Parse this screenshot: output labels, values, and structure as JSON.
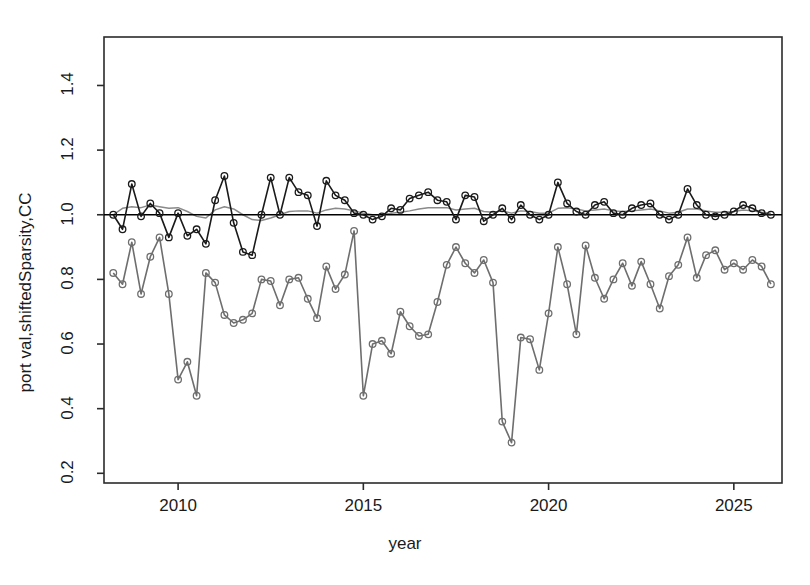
{
  "chart_data": {
    "type": "line",
    "title": "",
    "xlabel": "year",
    "ylabel": "port val,shiftedSparsity,CC",
    "xlim": [
      2008.0,
      2026.3
    ],
    "ylim": [
      0.17,
      1.55
    ],
    "xticks": [
      2010,
      2015,
      2020,
      2025
    ],
    "xtick_labels": [
      "2010",
      "2015",
      "2020",
      "2025"
    ],
    "yticks": [
      0.2,
      0.4,
      0.6,
      0.8,
      1.0,
      1.2,
      1.4
    ],
    "ytick_labels": [
      "0.2",
      "0.4",
      "0.6",
      "0.8",
      "1.0",
      "1.2",
      "1.4"
    ],
    "grid": false,
    "legend": "none",
    "box": true,
    "colors": {
      "port_val": "#1a1a1a",
      "reference": "#000000",
      "trend": "#8a8a8a",
      "sparsity": "#6e6e6e",
      "axis": "#2b2b2b",
      "background": "#ffffff"
    },
    "series": [
      {
        "name": "port val",
        "color": "#1a1a1a",
        "marker": "open-circle",
        "x": [
          2008.25,
          2008.5,
          2008.75,
          2009.0,
          2009.25,
          2009.5,
          2009.75,
          2010.0,
          2010.25,
          2010.5,
          2010.75,
          2011.0,
          2011.25,
          2011.5,
          2011.75,
          2012.0,
          2012.25,
          2012.5,
          2012.75,
          2013.0,
          2013.25,
          2013.5,
          2013.75,
          2014.0,
          2014.25,
          2014.5,
          2014.75,
          2015.0,
          2015.25,
          2015.5,
          2015.75,
          2016.0,
          2016.25,
          2016.5,
          2016.75,
          2017.0,
          2017.25,
          2017.5,
          2017.75,
          2018.0,
          2018.25,
          2018.5,
          2018.75,
          2019.0,
          2019.25,
          2019.5,
          2019.75,
          2020.0,
          2020.25,
          2020.5,
          2020.75,
          2021.0,
          2021.25,
          2021.5,
          2021.75,
          2022.0,
          2022.25,
          2022.5,
          2022.75,
          2023.0,
          2023.25,
          2023.5,
          2023.75,
          2024.0,
          2024.25,
          2024.5,
          2024.75,
          2025.0,
          2025.25,
          2025.5,
          2025.75,
          2026.0
        ],
        "y": [
          1.0,
          0.955,
          1.095,
          0.995,
          1.035,
          1.005,
          0.93,
          1.005,
          0.935,
          0.955,
          0.91,
          1.045,
          1.12,
          0.975,
          0.885,
          0.875,
          1.0,
          1.115,
          1.0,
          1.115,
          1.07,
          1.06,
          0.965,
          1.105,
          1.06,
          1.045,
          1.005,
          1.0,
          0.985,
          0.995,
          1.02,
          1.015,
          1.05,
          1.06,
          1.07,
          1.045,
          1.04,
          0.985,
          1.06,
          1.055,
          0.98,
          1.0,
          1.02,
          0.985,
          1.03,
          1.0,
          0.985,
          1.0,
          1.1,
          1.035,
          1.01,
          1.0,
          1.03,
          1.04,
          1.005,
          1.0,
          1.02,
          1.03,
          1.035,
          1.0,
          0.985,
          1.0,
          1.08,
          1.03,
          1.0,
          0.995,
          1.0,
          1.01,
          1.03,
          1.02,
          1.005,
          1.0
        ]
      },
      {
        "name": "shiftedSparsity",
        "color": "#6e6e6e",
        "marker": "open-circle",
        "x": [
          2008.25,
          2008.5,
          2008.75,
          2009.0,
          2009.25,
          2009.5,
          2009.75,
          2010.0,
          2010.25,
          2010.5,
          2010.75,
          2011.0,
          2011.25,
          2011.5,
          2011.75,
          2012.0,
          2012.25,
          2012.5,
          2012.75,
          2013.0,
          2013.25,
          2013.5,
          2013.75,
          2014.0,
          2014.25,
          2014.5,
          2014.75,
          2015.0,
          2015.25,
          2015.5,
          2015.75,
          2016.0,
          2016.25,
          2016.5,
          2016.75,
          2017.0,
          2017.25,
          2017.5,
          2017.75,
          2018.0,
          2018.25,
          2018.5,
          2018.75,
          2019.0,
          2019.25,
          2019.5,
          2019.75,
          2020.0,
          2020.25,
          2020.5,
          2020.75,
          2021.0,
          2021.25,
          2021.5,
          2021.75,
          2022.0,
          2022.25,
          2022.5,
          2022.75,
          2023.0,
          2023.25,
          2023.5,
          2023.75,
          2024.0,
          2024.25,
          2024.5,
          2024.75,
          2025.0,
          2025.25,
          2025.5,
          2025.75,
          2026.0
        ],
        "y": [
          0.82,
          0.785,
          0.915,
          0.755,
          0.87,
          0.93,
          0.755,
          0.49,
          0.545,
          0.44,
          0.82,
          0.79,
          0.69,
          0.665,
          0.675,
          0.695,
          0.8,
          0.795,
          0.72,
          0.8,
          0.805,
          0.74,
          0.68,
          0.84,
          0.77,
          0.815,
          0.95,
          0.44,
          0.6,
          0.61,
          0.57,
          0.7,
          0.655,
          0.625,
          0.63,
          0.73,
          0.845,
          0.9,
          0.85,
          0.82,
          0.86,
          0.79,
          0.36,
          0.295,
          0.62,
          0.615,
          0.52,
          0.695,
          0.9,
          0.785,
          0.63,
          0.905,
          0.805,
          0.74,
          0.8,
          0.85,
          0.78,
          0.855,
          0.785,
          0.71,
          0.81,
          0.845,
          0.93,
          0.805,
          0.875,
          0.89,
          0.83,
          0.85,
          0.83,
          0.86,
          0.84,
          0.785
        ]
      },
      {
        "name": "CC trend",
        "color": "#8a8a8a",
        "marker": "none",
        "x": [
          2008.25,
          2008.5,
          2008.75,
          2009.0,
          2009.25,
          2009.5,
          2009.75,
          2010.0,
          2010.25,
          2010.5,
          2010.75,
          2011.0,
          2011.25,
          2011.5,
          2011.75,
          2012.0,
          2012.25,
          2012.5,
          2012.75,
          2013.0,
          2013.25,
          2013.5,
          2013.75,
          2014.0,
          2014.25,
          2014.5,
          2014.75,
          2015.0,
          2015.25,
          2015.5,
          2015.75,
          2016.0,
          2016.25,
          2016.5,
          2016.75,
          2017.0,
          2017.25,
          2017.5,
          2017.75,
          2018.0,
          2018.25,
          2018.5,
          2018.75,
          2019.0,
          2019.25,
          2019.5,
          2019.75,
          2020.0,
          2020.25,
          2020.5,
          2020.75,
          2021.0,
          2021.25,
          2021.5,
          2021.75,
          2022.0,
          2022.25,
          2022.5,
          2022.75,
          2023.0,
          2023.25,
          2023.5,
          2023.75,
          2024.0,
          2024.25,
          2024.5,
          2024.75,
          2025.0,
          2025.25,
          2025.5,
          2025.75,
          2026.0
        ],
        "y": [
          1.0,
          1.02,
          1.025,
          1.022,
          1.03,
          1.025,
          1.02,
          1.022,
          1.01,
          0.995,
          0.99,
          1.015,
          1.025,
          1.018,
          1.0,
          0.985,
          0.982,
          0.99,
          1.0,
          1.01,
          1.012,
          1.012,
          1.005,
          1.015,
          1.02,
          1.018,
          1.012,
          1.005,
          1.0,
          1.0,
          1.005,
          1.008,
          1.012,
          1.018,
          1.022,
          1.022,
          1.022,
          1.015,
          1.018,
          1.02,
          1.01,
          1.008,
          1.012,
          1.005,
          1.012,
          1.01,
          1.005,
          1.005,
          1.02,
          1.022,
          1.018,
          1.012,
          1.015,
          1.018,
          1.012,
          1.01,
          1.012,
          1.015,
          1.018,
          1.012,
          1.005,
          1.008,
          1.018,
          1.018,
          1.012,
          1.008,
          1.008,
          1.01,
          1.015,
          1.012,
          1.008,
          1.005
        ]
      },
      {
        "name": "reference",
        "color": "#000000",
        "marker": "none",
        "constant_y": 1.0
      }
    ]
  },
  "axis_labels": {
    "x_title": "year",
    "y_title": "port val,shiftedSparsity,CC"
  }
}
